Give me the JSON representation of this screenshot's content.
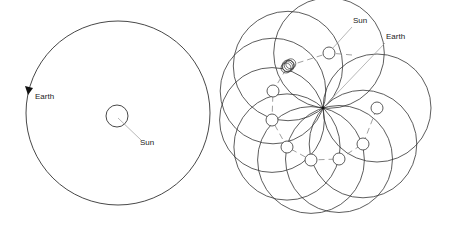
{
  "left_panel": {
    "title": "Heliocentric view",
    "labels": {
      "earth": "Earth",
      "sun": "Sun"
    },
    "orbit": {
      "cx": 118,
      "cy": 113,
      "r": 92
    },
    "sun": {
      "cx": 117,
      "cy": 116,
      "r": 11
    },
    "direction_arrow": "counterclockwise"
  },
  "right_panel": {
    "title": "Geocentric view",
    "labels": {
      "sun": "Sun",
      "earth": "Earth"
    },
    "earth_point": {
      "x": 323,
      "y": 108
    },
    "sun_positions": [
      [
        329,
        53
      ],
      [
        288,
        66
      ],
      [
        273,
        91
      ],
      [
        272,
        120
      ],
      [
        287,
        147
      ],
      [
        311,
        160
      ],
      [
        339,
        159
      ],
      [
        363,
        144
      ],
      [
        377,
        108
      ]
    ],
    "sun_r": 6
  },
  "colors": {
    "line": "#333333",
    "dash": "#888888",
    "leader": "#999999"
  }
}
